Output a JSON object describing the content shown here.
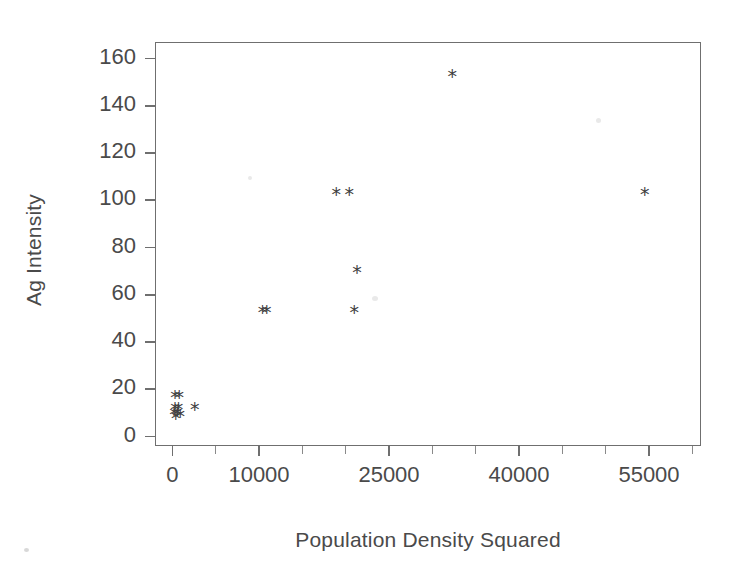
{
  "chart_data": {
    "type": "scatter",
    "title": "",
    "xlabel": "Population Density Squared",
    "ylabel": "Ag Intensity",
    "xlim": [
      -2000,
      61000
    ],
    "ylim": [
      -4,
      167
    ],
    "grid": false,
    "legend": null,
    "marker": "*",
    "marker_color": "#3f3f3f",
    "x_tick_labels": [
      "0",
      "10000",
      "25000",
      "40000",
      "55000"
    ],
    "x_tick_values": [
      0,
      10000,
      25000,
      40000,
      55000
    ],
    "x_minor_ticks": [
      5000,
      15000,
      20000,
      30000,
      35000,
      45000,
      50000,
      60000
    ],
    "y_tick_labels": [
      "0",
      "20",
      "40",
      "60",
      "80",
      "100",
      "120",
      "140",
      "160"
    ],
    "y_tick_values": [
      0,
      20,
      40,
      60,
      80,
      100,
      120,
      140,
      160
    ],
    "points": [
      {
        "x": 300,
        "y": 18
      },
      {
        "x": 800,
        "y": 18
      },
      {
        "x": 300,
        "y": 13
      },
      {
        "x": 700,
        "y": 13
      },
      {
        "x": 200,
        "y": 11
      },
      {
        "x": 600,
        "y": 11
      },
      {
        "x": 400,
        "y": 9
      },
      {
        "x": 900,
        "y": 10
      },
      {
        "x": 2600,
        "y": 13
      },
      {
        "x": 10400,
        "y": 54
      },
      {
        "x": 10900,
        "y": 54
      },
      {
        "x": 18900,
        "y": 104
      },
      {
        "x": 20400,
        "y": 104
      },
      {
        "x": 21300,
        "y": 71
      },
      {
        "x": 21000,
        "y": 54
      },
      {
        "x": 32300,
        "y": 154
      },
      {
        "x": 54500,
        "y": 104
      }
    ]
  },
  "axes": {
    "x_title": "Population Density Squared",
    "y_title": "Ag Intensity"
  }
}
